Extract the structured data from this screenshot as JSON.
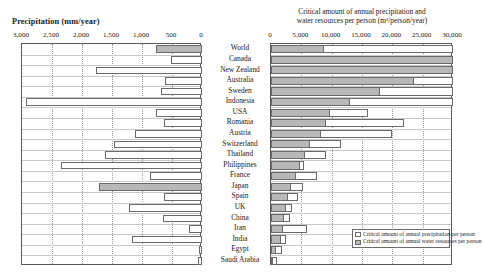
{
  "left_panel": {
    "title": "Precipitation (mm/year)",
    "axis_ticks": [
      "3,000",
      "2,500",
      "2,000",
      "1,500",
      "1,000",
      "500",
      "0"
    ]
  },
  "right_panel": {
    "title_line1": "Critical amount of annual precipitation and",
    "title_line2": "water resources per person (m³/person/year)",
    "axis_ticks": [
      "0",
      "5,000",
      "10,000",
      "15,000",
      "20,000",
      "25,000",
      "30,000"
    ],
    "legend": [
      {
        "label": "Critical amount of annual precipitation per person",
        "swatch": "white"
      },
      {
        "label": "Critical amount of annual water resources per person",
        "swatch": "gray"
      }
    ]
  },
  "categories": [
    "World",
    "Canada",
    "New Zealand",
    "Australia",
    "Sweden",
    "Indonesia",
    "USA",
    "Romania",
    "Austria",
    "Switzerland",
    "Thailand",
    "Philippines",
    "France",
    "Japan",
    "Spain",
    "UK",
    "China",
    "Iran",
    "India",
    "Egypt",
    "Saudi Arabia"
  ],
  "chart_data": {
    "type": "bar",
    "layout": "back-to-back horizontal bars, shared country axis in centre",
    "categories": [
      "World",
      "Canada",
      "New Zealand",
      "Australia",
      "Sweden",
      "Indonesia",
      "USA",
      "Romania",
      "Austria",
      "Switzerland",
      "Thailand",
      "Philippines",
      "France",
      "Japan",
      "Spain",
      "UK",
      "China",
      "Iran",
      "India",
      "Egypt",
      "Saudi Arabia"
    ],
    "panels": [
      {
        "name": "left",
        "title": "Precipitation (mm/year)",
        "xlabel": "Precipitation (mm/year)",
        "ylabel": "",
        "xlim": [
          3000,
          0
        ],
        "reversed_axis": true,
        "grid": true,
        "tick_values": [
          3000,
          2500,
          2000,
          1500,
          1000,
          500,
          0
        ],
        "tick_labels": [
          "3,000",
          "2,500",
          "2,000",
          "1,500",
          "1,000",
          "500",
          "0"
        ],
        "series": [
          {
            "name": "Precipitation",
            "values": [
              760,
              520,
              1760,
              610,
              680,
              2930,
              760,
              640,
              1110,
              1460,
              1620,
              2350,
              870,
              1720,
              640,
              1220,
              650,
              220,
              1170,
              50,
              60
            ],
            "highlighted": [
              "World",
              "Japan"
            ],
            "highlight_color": "#b8b8b8",
            "fill_color": "#ffffff"
          }
        ]
      },
      {
        "name": "right",
        "title": "Critical amount of annual precipitation and water resources per person (m³/person/year)",
        "xlabel": "m³/person/year",
        "ylabel": "",
        "xlim": [
          0,
          30000
        ],
        "grid": true,
        "tick_values": [
          0,
          5000,
          10000,
          15000,
          20000,
          25000,
          30000
        ],
        "tick_labels": [
          "0",
          "5,000",
          "10,000",
          "15,000",
          "20,000",
          "25,000",
          "30,000"
        ],
        "legend_position": "bottom-right inside axes",
        "series": [
          {
            "name": "Critical amount of annual precipitation per person",
            "fill_color": "#ffffff",
            "values": [
              30000,
              30000,
              30000,
              30000,
              30000,
              30000,
              16000,
              22000,
              20000,
              11500,
              9000,
              5500,
              7500,
              5200,
              4500,
              3400,
              3200,
              5900,
              2400,
              1800,
              1000
            ]
          },
          {
            "name": "Critical amount of annual water resources per person",
            "fill_color": "#b8b8b8",
            "values": [
              8700,
              30000,
              30000,
              23500,
              18000,
              13000,
              9800,
              9000,
              8200,
              6400,
              5600,
              4700,
              4100,
              3300,
              2800,
              2400,
              2200,
              2000,
              1700,
              900,
              400
            ]
          }
        ]
      }
    ]
  }
}
